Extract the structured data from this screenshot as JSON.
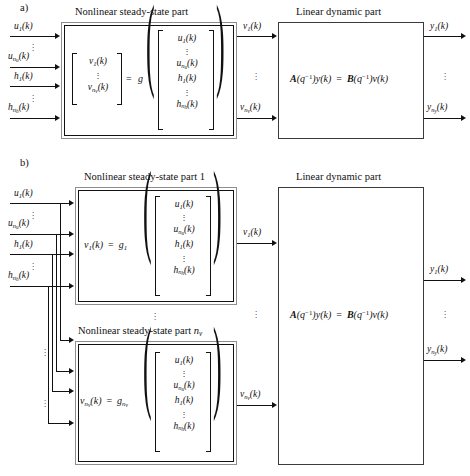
{
  "figure": {
    "panels": [
      {
        "tag": "a)",
        "nonlinear_title": "Nonlinear steady-state part",
        "linear_title": "Linear dynamic part",
        "inputs": [
          "u₁(k)",
          "u_{n_u}(k)",
          "h₁(k)",
          "h_{n_h}(k)"
        ],
        "intermediate": [
          "v₁(k)",
          "v_{n_v}(k)"
        ],
        "outputs": [
          "y₁(k)",
          "y_{n_y}(k)"
        ],
        "nonlinear_equation": "[v₁(k) ⋮ v_{n_v}(k)] = g([u₁(k) ⋮ u_{n_u}(k) h₁(k) ⋮ h_{n_h}(k)])",
        "linear_equation": "A(q⁻¹)y(k) = B(q⁻¹)v(k)"
      },
      {
        "tag": "b)",
        "nonlinear_title_1": "Nonlinear steady-state part 1",
        "nonlinear_title_2": "Nonlinear steady-state part n_v",
        "linear_title": "Linear dynamic part",
        "inputs": [
          "u₁(k)",
          "u_{n_u}(k)",
          "h₁(k)",
          "h_{n_h}(k)"
        ],
        "intermediate": [
          "v₁(k)",
          "v_{n_v}(k)"
        ],
        "outputs": [
          "y₁(k)",
          "y_{n_y}(k)"
        ],
        "nonlinear_equation_1": "v₁(k) = g₁([u₁(k) ⋮ u_{n_u}(k) h₁(k) ⋮ h_{n_h}(k)])",
        "nonlinear_equation_2": "v_{n_v}(k) = g_{n_v}([u₁(k) ⋮ u_{n_u}(k) h₁(k) ⋮ h_{n_h}(k)])",
        "linear_equation": "A(q⁻¹)y(k) = B(q⁻¹)v(k)"
      }
    ],
    "vector_entries": [
      "u₁(k)",
      "u_{n_u}(k)",
      "h₁(k)",
      "h_{n_h}(k)"
    ],
    "output_vector_entries": [
      "v₁(k)",
      "v_{n_v}(k)"
    ],
    "ellipsis": "⋮",
    "colors": {
      "line": "#111111",
      "frame_outer": "#8e8e8e",
      "frame_inner": "#111111",
      "background": "#ffffff"
    }
  },
  "panel_a": {
    "tag": "a)",
    "titles": {
      "nonlinear": "Nonlinear steady-state part",
      "linear": "Linear dynamic part"
    },
    "inputs": [
      {
        "label_main": "u",
        "sub": "1",
        "tail": "(k)"
      },
      {
        "label_main": "u",
        "sub": "n",
        "subsub": "u",
        "tail": "(k)"
      },
      {
        "label_main": "h",
        "sub": "1",
        "tail": "(k)"
      },
      {
        "label_main": "h",
        "sub": "n",
        "subsub": "h",
        "tail": "(k)"
      }
    ],
    "mid_signals": [
      {
        "label_main": "v",
        "sub": "1",
        "tail": "(k)"
      },
      {
        "label_main": "v",
        "sub": "n",
        "subsub": "v",
        "tail": "(k)"
      }
    ],
    "outputs": [
      {
        "label_main": "y",
        "sub": "1",
        "tail": "(k)"
      },
      {
        "label_main": "y",
        "sub": "n",
        "subsub": "y",
        "tail": "(k)"
      }
    ],
    "g_symbol": "g",
    "equals": "=",
    "linear_eq_parts": {
      "A": "A",
      "q_inv": "(q",
      "exp": "-1",
      "y": ")y(k)",
      "eq": "=",
      "B": "B",
      "v": ")v(k)"
    }
  },
  "panel_b": {
    "tag": "b)",
    "titles": {
      "nonlinear_1": "Nonlinear steady-state part 1",
      "nonlinear_n_prefix": "Nonlinear steady-state part ",
      "nonlinear_n_sub_main": "n",
      "nonlinear_n_sub_sub": "v",
      "linear": "Linear dynamic part"
    },
    "g1": {
      "v": "v",
      "vsub": "1",
      "vtail": "(k)",
      "eq": "=",
      "g": "g",
      "gsub": "1"
    },
    "gn": {
      "v": "v",
      "vsub": "n",
      "vsubsub": "v",
      "vtail": "(k)",
      "eq": "=",
      "g": "g",
      "gsub": "n",
      "gsubsub": "v"
    }
  },
  "vector": {
    "rows": [
      {
        "main": "u",
        "sub": "1",
        "tail": "(k)"
      },
      {
        "dots": "⋮"
      },
      {
        "main": "u",
        "sub": "n",
        "subsub": "u",
        "tail": "(k)"
      },
      {
        "main": "h",
        "sub": "1",
        "tail": "(k)"
      },
      {
        "dots": "⋮"
      },
      {
        "main": "h",
        "sub": "n",
        "subsub": "h",
        "tail": "(k)"
      }
    ],
    "v_rows": [
      {
        "main": "v",
        "sub": "1",
        "tail": "(k)"
      },
      {
        "dots": "⋮"
      },
      {
        "main": "v",
        "sub": "n",
        "subsub": "v",
        "tail": "(k)"
      }
    ]
  }
}
